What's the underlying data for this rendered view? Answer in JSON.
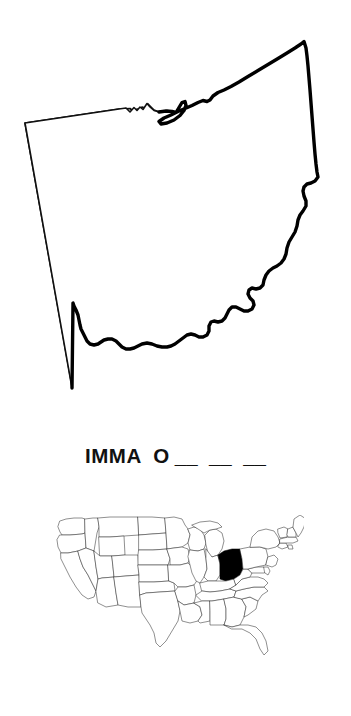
{
  "page": {
    "type": "worksheet",
    "background_color": "#ffffff",
    "ink_color": "#000000"
  },
  "state_outline": {
    "name": "ohio-state-outline",
    "state": "Ohio",
    "stroke_color": "#000000",
    "fill_color": "#ffffff",
    "description": "Blank outline map of the state of Ohio"
  },
  "prompt": {
    "name": "fill-in-the-blank-prompt",
    "text": "IMMA  O",
    "blanks": "__  __  __",
    "blank_count": 3,
    "answer_hint_letter": "O",
    "full_line": "IMMA  O __  __  __"
  },
  "locator_map": {
    "name": "united-states-locator-map",
    "title": "United States",
    "highlighted_state": "Ohio",
    "highlight_color": "#000000",
    "outline_color": "#333333",
    "fill_color": "#ffffff",
    "description": "Map of the contiguous United States with Ohio filled solid black"
  }
}
